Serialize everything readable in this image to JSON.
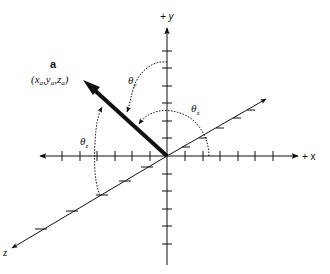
{
  "diagram": {
    "axes": {
      "x": {
        "label": "+ x"
      },
      "y": {
        "label": "+ y"
      },
      "z": {
        "label": "z"
      }
    },
    "vector": {
      "name": "a",
      "coords_label": "(xₐ, yₐ, zₐ)",
      "coords_parts": {
        "open": "(",
        "x": "x",
        "y": "y",
        "z": "z",
        "sub": "a",
        "close": ")"
      }
    },
    "angles": {
      "theta_x": {
        "symbol": "θ",
        "sub": "x"
      },
      "theta_y": {
        "symbol": "θ",
        "sub": "y"
      },
      "theta_z": {
        "symbol": "θ",
        "sub": "z"
      }
    },
    "colors": {
      "ink": "#111111",
      "background": "#ffffff"
    }
  }
}
